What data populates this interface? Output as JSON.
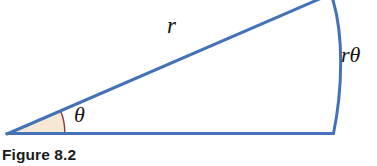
{
  "figure": {
    "caption": "Figure 8.2",
    "background_color": "#ffffff",
    "stroke_color": "#4472b8",
    "sector_fill_color": "#f7e8d5",
    "sector_arc_color": "#8b3a3a",
    "text_color": "#15110f"
  },
  "labels": {
    "radius": "r",
    "angle": "θ",
    "arc_length": "rθ"
  },
  "geometry": {
    "vertex": {
      "x": 8,
      "y": 133
    },
    "baseline_end": {
      "x": 333,
      "y": 133
    },
    "angle_degrees": 22,
    "angle_marker_radius": 57,
    "upper_ray_exit": {
      "x": 323,
      "y": 0
    },
    "arc_top": {
      "x": 331,
      "y": 0
    },
    "arc_bottom": {
      "x": 333,
      "y": 133
    }
  },
  "elements": {
    "radius_line_name": "radius-line",
    "baseline_name": "baseline",
    "arc_name": "arc-r-theta",
    "sector_name": "angle-sector"
  }
}
